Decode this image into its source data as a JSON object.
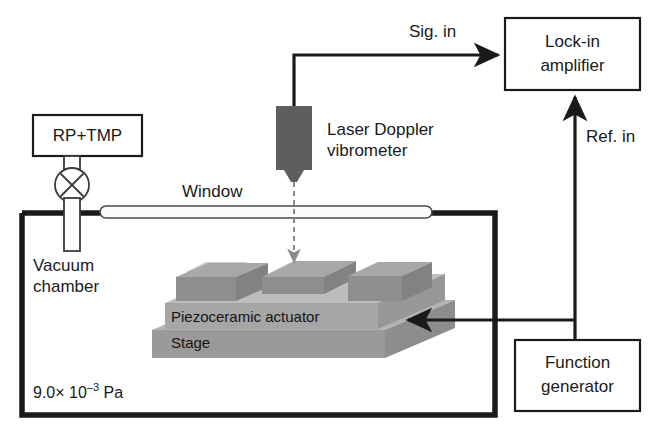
{
  "figure": {
    "type": "schematic-diagram",
    "background_color": "#ffffff",
    "line_color": "#1a1a1a"
  },
  "boxes": {
    "pump": {
      "label": "RP+TMP"
    },
    "lockin": {
      "label_line1": "Lock-in",
      "label_line2": "amplifier"
    },
    "function_generator": {
      "label_line1": "Function",
      "label_line2": "generator"
    }
  },
  "labels": {
    "window": "Window",
    "vacuum_chamber_line1": "Vacuum",
    "vacuum_chamber_line2": "chamber",
    "vibrometer_line1": "Laser Doppler",
    "vibrometer_line2": "vibrometer",
    "piezo": "Piezoceramic actuator",
    "stage": "Stage"
  },
  "connections": {
    "signal_in": "Sig. in",
    "reference_in": "Ref. in"
  },
  "pressure": {
    "mantissa": "9.0× 10",
    "exponent": "–3",
    "unit": "Pa",
    "full": "9.0× 10–3 Pa"
  },
  "components": {
    "valve_icon": "crossed-circle-valve",
    "vibrometer_icon": "vibrometer-head",
    "laser_beam_icon": "dashed-laser-beam"
  },
  "colors": {
    "stage_gray": "#9a9a9a",
    "piezo_gray": "#a6a6a6",
    "vibrometer_gray": "#5e5e5e",
    "beam_gray": "#8a8a8a"
  }
}
